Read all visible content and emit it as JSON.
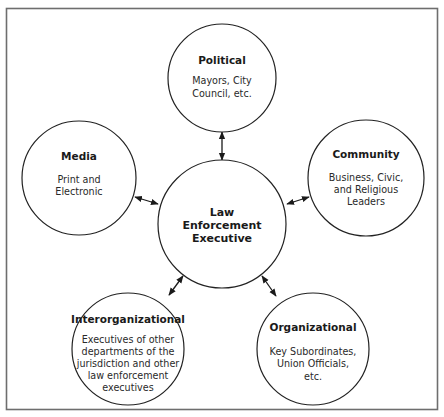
{
  "diagram": {
    "colors": {
      "frame": "#6e6e6e",
      "circle_stroke": "#222222",
      "text": "#1a1a1a",
      "background": "#ffffff"
    },
    "center": {
      "title_lines": [
        "Law",
        "Enforcement",
        "Executive"
      ]
    },
    "nodes": {
      "political": {
        "title": "Political",
        "desc_lines": [
          "Mayors, City",
          "Council, etc."
        ]
      },
      "media": {
        "title": "Media",
        "desc_lines": [
          "Print and",
          "Electronic"
        ]
      },
      "community": {
        "title": "Community",
        "desc_lines": [
          "Business, Civic,",
          "and Religious",
          "Leaders"
        ]
      },
      "interorganizational": {
        "title": "Interorganizational",
        "desc_lines": [
          "Executives of other",
          "departments of the",
          "jurisdiction and other",
          "law enforcement",
          "executives"
        ]
      },
      "organizational": {
        "title": "Organizational",
        "desc_lines": [
          "Key Subordinates,",
          "Union Officials,",
          "etc."
        ]
      }
    },
    "connections": [
      {
        "from": "center",
        "to": "political",
        "type": "bidirectional-arrow"
      },
      {
        "from": "center",
        "to": "media",
        "type": "bidirectional-arrow"
      },
      {
        "from": "center",
        "to": "community",
        "type": "bidirectional-arrow"
      },
      {
        "from": "center",
        "to": "interorganizational",
        "type": "bidirectional-arrow"
      },
      {
        "from": "center",
        "to": "organizational",
        "type": "bidirectional-arrow"
      }
    ]
  }
}
